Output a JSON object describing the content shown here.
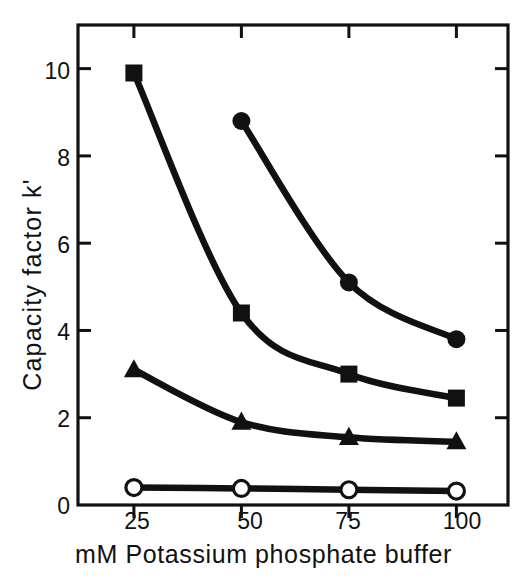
{
  "chart_data": {
    "type": "line",
    "title": "",
    "xlabel": "mM Potassium phosphate buffer",
    "ylabel": "Capacity factor  k'",
    "x": [
      25,
      50,
      75,
      100
    ],
    "xticklabels": [
      "25",
      "50",
      "75",
      "100"
    ],
    "yticklabels": [
      "0",
      "2",
      "4",
      "6",
      "8",
      "10"
    ],
    "yticks": [
      0,
      2,
      4,
      6,
      8,
      10
    ],
    "xlim": [
      12,
      112
    ],
    "ylim": [
      0,
      11
    ],
    "grid": false,
    "legend": "none",
    "series": [
      {
        "name": "filled-circle-series",
        "marker": "filled-circle",
        "color": "#111111",
        "x": [
          50,
          75,
          100
        ],
        "values": [
          8.8,
          5.1,
          3.8
        ]
      },
      {
        "name": "filled-square-series",
        "marker": "filled-square",
        "color": "#111111",
        "x": [
          25,
          50,
          75,
          100
        ],
        "values": [
          9.9,
          4.4,
          3.0,
          2.45
        ]
      },
      {
        "name": "filled-triangle-series",
        "marker": "filled-triangle",
        "color": "#111111",
        "x": [
          25,
          50,
          75,
          100
        ],
        "values": [
          3.1,
          1.9,
          1.55,
          1.45
        ]
      },
      {
        "name": "open-circle-series",
        "marker": "open-circle",
        "color": "#111111",
        "x": [
          25,
          50,
          75,
          100
        ],
        "values": [
          0.4,
          0.38,
          0.35,
          0.32
        ]
      }
    ]
  },
  "axes": {
    "ylabel": "Capacity factor  k'",
    "xlabel": "mM Potassium phosphate buffer",
    "xticks": [
      "25",
      "50",
      "75",
      "100"
    ],
    "yticks": [
      "0",
      "2",
      "4",
      "6",
      "8",
      "10"
    ]
  }
}
